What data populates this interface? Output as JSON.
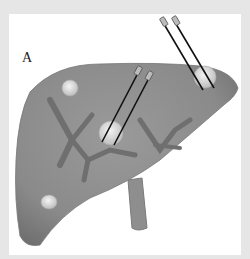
{
  "figure": {
    "panel_label": "A",
    "colors": {
      "background": "#e6e6e6",
      "panel": "#ffffff",
      "liver": "#8c8c8c",
      "vessels": "#6f6f6f",
      "lesion": "#d8d8d8",
      "probe": "#111111"
    },
    "lesions": [
      {
        "name": "lesion-upper-left",
        "cx": 70,
        "cy": 88
      },
      {
        "name": "lesion-center",
        "cx": 111,
        "cy": 133
      },
      {
        "name": "lesion-right",
        "cx": 205,
        "cy": 77
      },
      {
        "name": "lesion-lower-left",
        "cx": 49,
        "cy": 202
      }
    ],
    "probes": [
      {
        "name": "probe-center-1",
        "x1": 138,
        "y1": 73,
        "x2": 102,
        "y2": 142
      },
      {
        "name": "probe-center-2",
        "x1": 149,
        "y1": 78,
        "x2": 114,
        "y2": 145
      },
      {
        "name": "probe-right-1",
        "x1": 164,
        "y1": 22,
        "x2": 203,
        "y2": 90
      },
      {
        "name": "probe-right-2",
        "x1": 176,
        "y1": 22,
        "x2": 214,
        "y2": 88
      }
    ]
  }
}
